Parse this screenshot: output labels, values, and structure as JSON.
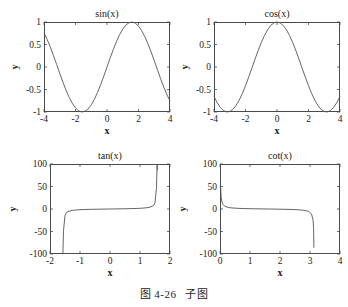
{
  "figure": {
    "caption_label": "图 4-26",
    "caption_text": "子图",
    "axis_color": "#4a4a4a",
    "curve_color": "#555555",
    "background": "#ffffff"
  },
  "chart_data": [
    {
      "type": "line",
      "title": "sin(x)",
      "xlabel": "x",
      "ylabel": "y",
      "xlim": [
        -4,
        4
      ],
      "ylim": [
        -1,
        1
      ],
      "xticks": [
        "-4",
        "-2",
        "0",
        "2",
        "4"
      ],
      "xtick_values": [
        -4,
        -2,
        0,
        2,
        4
      ],
      "yticks": [
        "-1",
        "-0.5",
        "0",
        "0.5",
        "1"
      ],
      "ytick_values": [
        -1,
        -0.5,
        0,
        0.5,
        1
      ],
      "grid": false,
      "legend": "none",
      "series": [
        {
          "name": "sin(x)",
          "x": [
            -4.0,
            -3.8,
            -3.6,
            -3.4,
            -3.2,
            -3.0,
            -2.8,
            -2.6,
            -2.4,
            -2.2,
            -2.0,
            -1.8,
            -1.6,
            -1.4,
            -1.2,
            -1.0,
            -0.8,
            -0.6,
            -0.4,
            -0.2,
            0.0,
            0.2,
            0.4,
            0.6,
            0.8,
            1.0,
            1.2,
            1.4,
            1.6,
            1.8,
            2.0,
            2.2,
            2.4,
            2.6,
            2.8,
            3.0,
            3.2,
            3.4,
            3.6,
            3.8,
            4.0
          ],
          "values": [
            0.757,
            0.612,
            0.443,
            0.256,
            0.058,
            -0.141,
            -0.335,
            -0.516,
            -0.675,
            -0.808,
            -0.909,
            -0.974,
            -1.0,
            -0.985,
            -0.932,
            -0.841,
            -0.717,
            -0.565,
            -0.389,
            -0.199,
            0.0,
            0.199,
            0.389,
            0.565,
            0.717,
            0.841,
            0.932,
            0.985,
            1.0,
            0.974,
            0.909,
            0.808,
            0.675,
            0.516,
            0.335,
            0.141,
            -0.058,
            -0.256,
            -0.443,
            -0.612,
            -0.757
          ]
        }
      ]
    },
    {
      "type": "line",
      "title": "cos(x)",
      "xlabel": "x",
      "ylabel": "y",
      "xlim": [
        -4,
        4
      ],
      "ylim": [
        -1,
        1
      ],
      "xticks": [
        "-4",
        "-2",
        "0",
        "2",
        "4"
      ],
      "xtick_values": [
        -4,
        -2,
        0,
        2,
        4
      ],
      "yticks": [
        "-1",
        "-0.5",
        "0",
        "0.5",
        "1"
      ],
      "ytick_values": [
        -1,
        -0.5,
        0,
        0.5,
        1
      ],
      "grid": false,
      "legend": "none",
      "series": [
        {
          "name": "cos(x)",
          "x": [
            -4.0,
            -3.8,
            -3.6,
            -3.4,
            -3.2,
            -3.0,
            -2.8,
            -2.6,
            -2.4,
            -2.2,
            -2.0,
            -1.8,
            -1.6,
            -1.4,
            -1.2,
            -1.0,
            -0.8,
            -0.6,
            -0.4,
            -0.2,
            0.0,
            0.2,
            0.4,
            0.6,
            0.8,
            1.0,
            1.2,
            1.4,
            1.6,
            1.8,
            2.0,
            2.2,
            2.4,
            2.6,
            2.8,
            3.0,
            3.2,
            3.4,
            3.6,
            3.8,
            4.0
          ],
          "values": [
            -0.654,
            -0.791,
            -0.897,
            -0.967,
            -0.998,
            -0.99,
            -0.942,
            -0.857,
            -0.737,
            -0.589,
            -0.416,
            -0.227,
            -0.029,
            0.17,
            0.362,
            0.54,
            0.697,
            0.825,
            0.921,
            0.98,
            1.0,
            0.98,
            0.921,
            0.825,
            0.697,
            0.54,
            0.362,
            0.17,
            -0.029,
            -0.227,
            -0.416,
            -0.589,
            -0.737,
            -0.857,
            -0.942,
            -0.99,
            -0.998,
            -0.967,
            -0.897,
            -0.791,
            -0.654
          ]
        }
      ]
    },
    {
      "type": "line",
      "title": "tan(x)",
      "xlabel": "x",
      "ylabel": "y",
      "xlim": [
        -2,
        2
      ],
      "ylim": [
        -100,
        100
      ],
      "xticks": [
        "-2",
        "-1",
        "0",
        "1",
        "2"
      ],
      "xtick_values": [
        -2,
        -1,
        0,
        1,
        2
      ],
      "yticks": [
        "-100",
        "-50",
        "0",
        "50",
        "100"
      ],
      "ytick_values": [
        -100,
        -50,
        0,
        50,
        100
      ],
      "grid": false,
      "legend": "none",
      "series": [
        {
          "name": "tan(x)",
          "x": [
            -1.5808,
            -1.57,
            -1.55,
            -1.5,
            -1.45,
            -1.4,
            -1.3,
            -1.2,
            -1.0,
            -0.8,
            -0.6,
            -0.4,
            -0.2,
            0.0,
            0.2,
            0.4,
            0.6,
            0.8,
            1.0,
            1.2,
            1.3,
            1.4,
            1.45,
            1.5,
            1.55,
            1.57,
            1.5808
          ],
          "values": [
            -100,
            -1255.8,
            -48.08,
            -14.1,
            -7.6,
            -5.8,
            -3.6,
            -2.57,
            -1.56,
            -1.03,
            -0.68,
            -0.42,
            -0.2,
            0.0,
            0.2,
            0.42,
            0.68,
            1.03,
            1.56,
            2.57,
            3.6,
            5.8,
            7.6,
            14.1,
            48.08,
            1255.8,
            86
          ]
        }
      ],
      "annotation": "vertical asymptotes near x = ±π/2"
    },
    {
      "type": "line",
      "title": "cot(x)",
      "xlabel": "x",
      "ylabel": "y",
      "xlim": [
        0,
        4
      ],
      "ylim": [
        -100,
        100
      ],
      "xticks": [
        "0",
        "1",
        "2",
        "3",
        "4"
      ],
      "xtick_values": [
        0,
        1,
        2,
        3,
        4
      ],
      "yticks": [
        "-100",
        "-50",
        "0",
        "50",
        "100"
      ],
      "ytick_values": [
        -100,
        -50,
        0,
        50,
        100
      ],
      "grid": false,
      "legend": "none",
      "series": [
        {
          "name": "cot(x)",
          "x": [
            0.012,
            0.02,
            0.04,
            0.07,
            0.1,
            0.15,
            0.2,
            0.3,
            0.4,
            0.6,
            0.8,
            1.0,
            1.2,
            1.4,
            1.6,
            1.8,
            2.0,
            2.2,
            2.4,
            2.6,
            2.8,
            2.95,
            3.05,
            3.1,
            3.12,
            3.13
          ],
          "values": [
            47,
            50.0,
            25.0,
            14.3,
            9.97,
            6.62,
            4.93,
            3.23,
            2.36,
            1.46,
            0.97,
            0.64,
            0.39,
            0.17,
            -0.03,
            -0.23,
            -0.46,
            -0.74,
            -1.12,
            -1.73,
            -2.98,
            -5.12,
            -10.9,
            -23.9,
            -42,
            -86
          ]
        }
      ],
      "annotation": "vertical asymptotes near x = 0 and x = π"
    }
  ]
}
